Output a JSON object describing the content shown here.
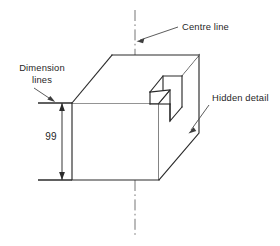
{
  "figure": {
    "background_color": "#ffffff"
  },
  "colors": {
    "solid_edge": "#2b2b2b",
    "hidden_edge": "#8a8a8a",
    "centre_line": "#6e6e6e",
    "dimension_line": "#2b2b2b",
    "leader_line": "#4a4a4a",
    "text": "#1f1f1f"
  },
  "annotations": {
    "centre_line": {
      "label": "Centre line",
      "text_x": 182,
      "text_y": 30
    },
    "dimension_lines": {
      "label_line1": "Dimension",
      "label_line2": "lines",
      "text_x": 42,
      "text_y_line1": 71,
      "text_y_line2": 83
    },
    "hidden_detail": {
      "label": "Hidden detail",
      "text_x": 212,
      "text_y": 101
    }
  },
  "dimensions": {
    "height_value": "99",
    "height_text_x": 51,
    "height_text_y": 140,
    "top_extension_y": 103,
    "bottom_extension_y": 180,
    "dim_line_x": 62
  },
  "geometry": {
    "type": "isometric-block-with-step-notch",
    "front_face": {
      "top_left_x": 72,
      "top_left_y": 103,
      "top_right_x": 159,
      "top_right_y": 103,
      "bottom_right_x": 159,
      "bottom_right_y": 180,
      "bottom_left_x": 72,
      "bottom_left_y": 180
    },
    "depth_offset_x": 40,
    "depth_offset_y": -48,
    "centre_line_x": 135,
    "centre_line_top_y": 10,
    "centre_line_bottom_y": 236
  },
  "icons": {
    "arrow_up": "arrow-up-icon",
    "arrow_down": "arrow-down-icon",
    "leader_arrow": "leader-arrow-icon"
  }
}
